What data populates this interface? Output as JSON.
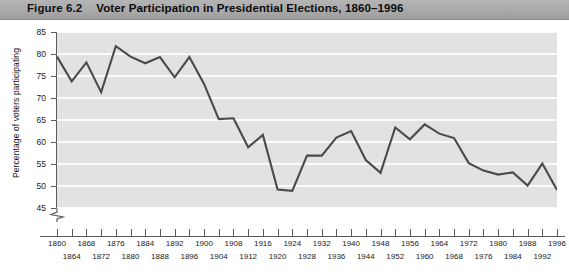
{
  "figure": {
    "number_label": "Figure 6.2",
    "title": "Voter Participation in Presidential Elections, 1860–1996"
  },
  "colors": {
    "title_band": "#a9a9a9",
    "plot_background": "#e2e2e2",
    "gridline": "#fbfbfb",
    "line": "#4a4a4a",
    "axis": "#5b5b5b",
    "text": "#111111"
  },
  "axes": {
    "y": {
      "title": "Percentage of voters participating",
      "ticks": [
        "85",
        "80",
        "75",
        "70",
        "65",
        "60",
        "55",
        "50",
        "45"
      ],
      "min": 45,
      "max": 85,
      "step": 5,
      "has_break": true,
      "break_icon": "axis-break-zigzag"
    },
    "x": {
      "title": "",
      "ticks_row0": [
        "1860",
        "1868",
        "1876",
        "1884",
        "1892",
        "1900",
        "1908",
        "1916",
        "1924",
        "1932",
        "1940",
        "1948",
        "1956",
        "1964",
        "1972",
        "1980",
        "1988",
        "1996"
      ],
      "ticks_row1": [
        "1864",
        "1872",
        "1880",
        "1888",
        "1896",
        "1904",
        "1912",
        "1920",
        "1928",
        "1936",
        "1944",
        "1952",
        "1960",
        "1968",
        "1976",
        "1984",
        "1992"
      ],
      "min": 1860,
      "max": 1996,
      "step": 4
    }
  },
  "chart_data": {
    "type": "line",
    "title": "Voter Participation in Presidential Elections, 1860–1996",
    "xlabel": "",
    "ylabel": "Percentage of voters participating",
    "xlim": [
      1860,
      1996
    ],
    "ylim": [
      45,
      85
    ],
    "grid": true,
    "legend": null,
    "x": [
      1860,
      1864,
      1868,
      1872,
      1876,
      1880,
      1884,
      1888,
      1892,
      1896,
      1900,
      1904,
      1908,
      1912,
      1916,
      1920,
      1924,
      1928,
      1932,
      1936,
      1940,
      1944,
      1948,
      1952,
      1956,
      1960,
      1964,
      1968,
      1972,
      1976,
      1980,
      1984,
      1988,
      1992,
      1996
    ],
    "values": [
      79.4,
      73.8,
      78.1,
      71.3,
      81.8,
      79.4,
      77.9,
      79.3,
      74.7,
      79.3,
      73.2,
      65.2,
      65.4,
      58.8,
      61.6,
      49.2,
      48.9,
      56.9,
      56.9,
      61.0,
      62.5,
      55.9,
      53.0,
      63.3,
      60.6,
      64.0,
      61.9,
      60.9,
      55.2,
      53.5,
      52.6,
      53.1,
      50.1,
      55.1,
      49.1
    ],
    "series_name": "Voter turnout (%)"
  }
}
